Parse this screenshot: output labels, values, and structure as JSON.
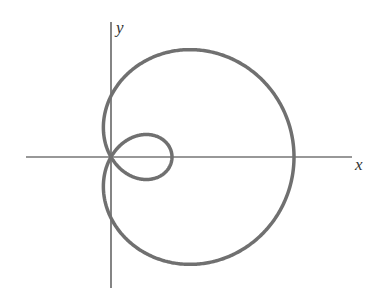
{
  "figure": {
    "x_label": "x",
    "y_label": "y",
    "curve_color": "#707070",
    "axis_color": "#333333"
  },
  "chart_data": {
    "type": "line",
    "title": "",
    "equation": "r = 1 + 2cos(theta)",
    "xlabel": "x",
    "ylabel": "y",
    "outer_loop_x_intercept": 3,
    "inner_loop_x_intercept": 1,
    "grid": false
  }
}
